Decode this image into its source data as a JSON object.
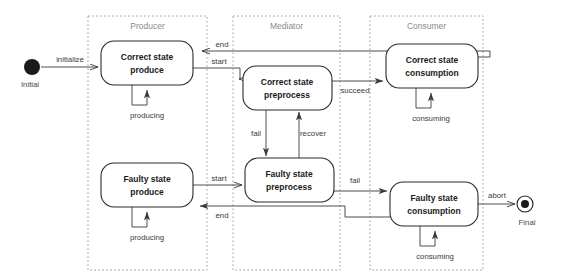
{
  "diagram": {
    "colors": {
      "lane_border": "#9b9b9b",
      "state_border": "#2b2b2b",
      "edge": "#3a3a3a",
      "lane_title_text": "#8a8a8a",
      "state_text": "#1a1a1a",
      "background": "#ffffff"
    }
  },
  "lanes": [
    {
      "id": "producer",
      "label": "Producer"
    },
    {
      "id": "mediator",
      "label": "Mediator"
    },
    {
      "id": "consumer",
      "label": "Consumer"
    }
  ],
  "nodes": {
    "initial": {
      "label": "Initial",
      "type": "initial-pseudostate"
    },
    "final": {
      "label": "Final",
      "type": "final-state"
    },
    "correct_produce": {
      "line1": "Correct  state",
      "line2": "produce"
    },
    "faulty_produce": {
      "line1": "Faulty  state",
      "line2": "produce"
    },
    "correct_preprocess": {
      "line1": "Correct state",
      "line2": "preprocess"
    },
    "faulty_preprocess": {
      "line1": "Faulty state",
      "line2": "preprocess"
    },
    "correct_consumption": {
      "line1": "Correct state",
      "line2": "consumption"
    },
    "faulty_consumption": {
      "line1": "Faulty state",
      "line2": "consumption"
    }
  },
  "transitions": [
    {
      "id": "initialize",
      "label": "initialize",
      "from": "initial",
      "to": "correct_produce"
    },
    {
      "id": "start_top",
      "label": "start",
      "from": "correct_produce",
      "to": "correct_preprocess"
    },
    {
      "id": "end_top",
      "label": "end",
      "from": "correct_consumption",
      "to": "correct_produce"
    },
    {
      "id": "succeed",
      "label": "succeed",
      "from": "correct_preprocess",
      "to": "correct_consumption"
    },
    {
      "id": "fail_vertical",
      "label": "fail",
      "from": "correct_preprocess",
      "to": "faulty_preprocess"
    },
    {
      "id": "recover",
      "label": "recover",
      "from": "faulty_preprocess",
      "to": "correct_preprocess"
    },
    {
      "id": "start_bottom",
      "label": "start",
      "from": "faulty_produce",
      "to": "faulty_preprocess"
    },
    {
      "id": "end_bottom",
      "label": "end",
      "from": "faulty_consumption",
      "to": "faulty_produce"
    },
    {
      "id": "fail_bottom",
      "label": "fail",
      "from": "faulty_preprocess",
      "to": "faulty_consumption"
    },
    {
      "id": "abort",
      "label": "abort",
      "from": "faulty_consumption",
      "to": "final"
    }
  ],
  "self_transitions": [
    {
      "id": "producing_correct",
      "label": "producing",
      "on": "correct_produce"
    },
    {
      "id": "producing_faulty",
      "label": "producing",
      "on": "faulty_produce"
    },
    {
      "id": "consuming_correct",
      "label": "consuming",
      "on": "correct_consumption"
    },
    {
      "id": "consuming_faulty",
      "label": "consuming",
      "on": "faulty_consumption"
    }
  ]
}
